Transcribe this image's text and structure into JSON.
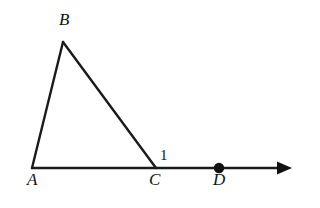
{
  "figure": {
    "kind": "euclidean-geometry-diagram",
    "width": 320,
    "height": 208,
    "background_color": "#ffffff",
    "stroke_color": "#1a1a1a",
    "stroke_width": 2.4
  },
  "labels": {
    "vertex_a": "A",
    "vertex_b": "B",
    "vertex_c": "C",
    "point_d": "D",
    "angle_one": "1"
  },
  "chart_data": {
    "type": "diagram",
    "title": "",
    "points": [
      {
        "name": "A",
        "x": 32,
        "y": 168,
        "label": "A",
        "label_x": 27,
        "label_y": 171,
        "marker": "none"
      },
      {
        "name": "B",
        "x": 63,
        "y": 42,
        "label": "B",
        "label_x": 59,
        "label_y": 11,
        "marker": "none"
      },
      {
        "name": "C",
        "x": 156,
        "y": 168,
        "label": "C",
        "label_x": 149,
        "label_y": 171,
        "marker": "none"
      },
      {
        "name": "D",
        "x": 219,
        "y": 168,
        "label": "D",
        "label_x": 213,
        "label_y": 171,
        "marker": "dot"
      }
    ],
    "segments": [
      {
        "name": "AB",
        "from": "A",
        "to": "B",
        "x1": 32,
        "y1": 168,
        "x2": 63,
        "y2": 42
      },
      {
        "name": "BC",
        "from": "B",
        "to": "C",
        "x1": 63,
        "y1": 42,
        "x2": 156,
        "y2": 168
      },
      {
        "name": "AC",
        "from": "A",
        "to": "C",
        "x1": 32,
        "y1": 168,
        "x2": 156,
        "y2": 168
      }
    ],
    "rays": [
      {
        "name": "AD-ray",
        "from": "A",
        "x1": 32,
        "y1": 168,
        "x2": 292,
        "y2": 168,
        "arrow": "end",
        "arrow_tip_x": 292,
        "arrow_base_x": 277,
        "arrow_half_height": 6.5
      }
    ],
    "markers": [
      {
        "name": "D-dot",
        "x": 219,
        "y": 168,
        "r": 5.2,
        "fill": "#111111"
      }
    ],
    "angle_marks": [
      {
        "name": "angle-1",
        "at_vertex": "C",
        "text": "1",
        "text_x": 160,
        "text_y": 148,
        "meaning": "exterior angle BCD"
      }
    ],
    "axis_ranges": {
      "x": [
        0,
        320
      ],
      "y": [
        0,
        208
      ]
    },
    "grid": false,
    "legend": "none"
  }
}
